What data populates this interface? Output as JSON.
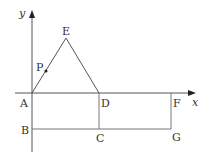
{
  "diagram": {
    "axes": {
      "x_label": "x",
      "y_label": "y",
      "origin": "A"
    },
    "points": {
      "A": "A",
      "B": "B",
      "C": "C",
      "D": "D",
      "E": "E",
      "F": "F",
      "G": "G",
      "P": "P"
    },
    "shapes": [
      {
        "type": "triangle",
        "vertices": [
          "A",
          "E",
          "D"
        ]
      },
      {
        "type": "rectangle",
        "vertices": [
          "A",
          "B",
          "C",
          "D"
        ]
      },
      {
        "type": "rectangle",
        "vertices": [
          "D",
          "C",
          "G",
          "F"
        ]
      }
    ],
    "moving_point": {
      "name": "P",
      "on_segment": "AE"
    },
    "colors": {
      "line": "#555555",
      "text": "#333333"
    }
  }
}
